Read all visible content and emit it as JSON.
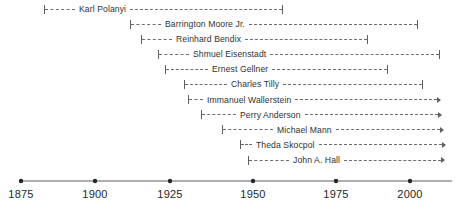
{
  "chart_data": {
    "type": "timeline",
    "title": "",
    "xlabel": "",
    "ylabel": "",
    "xlim": [
      1875,
      2009
    ],
    "xticks": [
      1875,
      1900,
      1925,
      1950,
      1975,
      2000
    ],
    "xtick_labels": [
      "1875",
      "1900",
      "1925",
      "1950",
      "1975",
      "2000"
    ],
    "grid": false,
    "legend": "none",
    "axis_color": "#5b5f66",
    "bar_color": "#6a6e75",
    "label_color": "#2f3237",
    "bars": [
      {
        "label": "Karl Polanyi",
        "start_year": 1883,
        "end_year": 1963,
        "start_px": 44,
        "end_px": 283,
        "lead_px": 30,
        "end_marker": "bar"
      },
      {
        "label": "Barrington Moore Jr.",
        "start_year": 1912,
        "end_year": 2008,
        "start_px": 130,
        "end_px": 418,
        "lead_px": 30,
        "end_marker": "bar"
      },
      {
        "label": "Reinhard Bendix",
        "start_year": 1916,
        "end_year": 1992,
        "start_px": 141,
        "end_px": 368,
        "lead_px": 30,
        "end_marker": "bar"
      },
      {
        "label": "Shmuel Eisenstadt",
        "start_year": 1923,
        "end_year": 2010,
        "start_px": 158,
        "end_px": 440,
        "lead_px": 30,
        "end_marker": "bar"
      },
      {
        "label": "Ernest Gellner",
        "start_year": 1925,
        "end_year": 1995,
        "start_px": 165,
        "end_px": 388,
        "lead_px": 42,
        "end_marker": "bar"
      },
      {
        "label": "Charles Tilly",
        "start_year": 1929,
        "end_year": 2008,
        "start_px": 184,
        "end_px": 423,
        "lead_px": 42,
        "end_marker": "bar"
      },
      {
        "label": "Immanuel Wallerstein",
        "start_year": 1930,
        "end_year": 2009,
        "start_px": 188,
        "end_px": 441,
        "lead_px": 14,
        "end_marker": "arrow"
      },
      {
        "label": "Perry Anderson",
        "start_year": 1938,
        "end_year": 2009,
        "start_px": 201,
        "end_px": 442,
        "lead_px": 34,
        "end_marker": "arrow"
      },
      {
        "label": "Michael Mann",
        "start_year": 1942,
        "end_year": 2009,
        "start_px": 222,
        "end_px": 444,
        "lead_px": 50,
        "end_marker": "arrow"
      },
      {
        "label": "Theda Skocpol",
        "start_year": 1947,
        "end_year": 2009,
        "start_px": 240,
        "end_px": 446,
        "lead_px": 11,
        "end_marker": "arrow"
      },
      {
        "label": "John A. Hall",
        "start_year": 1949,
        "end_year": 2009,
        "start_px": 248,
        "end_px": 445,
        "lead_px": 40,
        "end_marker": "arrow"
      }
    ]
  }
}
